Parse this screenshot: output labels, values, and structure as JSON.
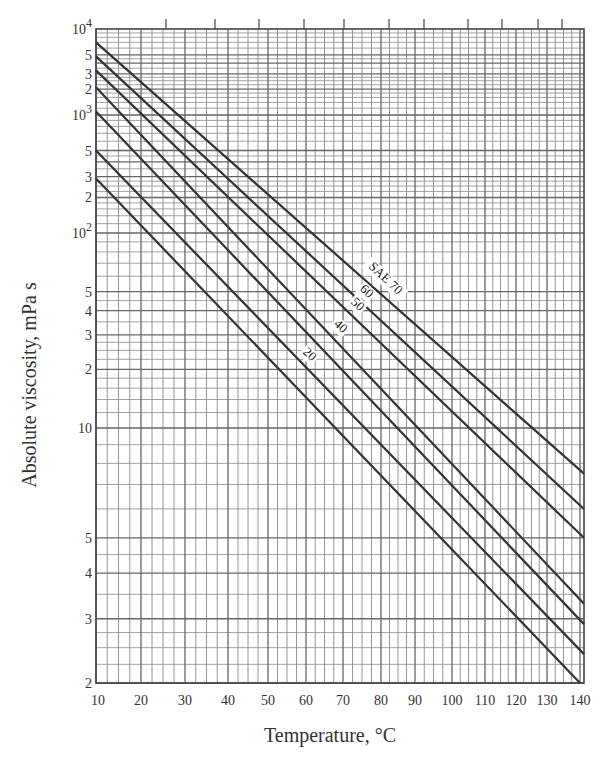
{
  "chart_data": {
    "type": "line",
    "title": "",
    "xlabel": "Temperature, °C",
    "ylabel": "Absolute viscosity, mPa s",
    "xscale": "viscosity-temperature (nonlinear)",
    "yscale": "log (viscosity-chart distorted)",
    "xlim": [
      10,
      142
    ],
    "ylim": [
      2,
      10000
    ],
    "grid": true,
    "legend": "inline labels on lines",
    "x_ticks": [
      10,
      20,
      30,
      40,
      50,
      60,
      70,
      80,
      90,
      100,
      110,
      120,
      130,
      140
    ],
    "x_tick_labels": [
      "10",
      "20",
      "30",
      "40",
      "50",
      "60",
      "70",
      "80",
      "90",
      "100",
      "110",
      "120",
      "130",
      "140"
    ],
    "y_ticks": [
      {
        "value": 10000,
        "label": "10",
        "sup": "4"
      },
      {
        "value": 5000,
        "label": "5"
      },
      {
        "value": 3000,
        "label": "3"
      },
      {
        "value": 2000,
        "label": "2"
      },
      {
        "value": 1000,
        "label": "10",
        "sup": "3"
      },
      {
        "value": 500,
        "label": "5"
      },
      {
        "value": 300,
        "label": "3"
      },
      {
        "value": 200,
        "label": "2"
      },
      {
        "value": 100,
        "label": "10",
        "sup": "2"
      },
      {
        "value": 50,
        "label": "5"
      },
      {
        "value": 40,
        "label": "4"
      },
      {
        "value": 30,
        "label": "3"
      },
      {
        "value": 20,
        "label": "2"
      },
      {
        "value": 10,
        "label": "10"
      },
      {
        "value": 5,
        "label": "5"
      },
      {
        "value": 4,
        "label": "4"
      },
      {
        "value": 3,
        "label": "3"
      },
      {
        "value": 2,
        "label": "2"
      }
    ],
    "series": [
      {
        "name": "SAE 70",
        "label": "SAE 70",
        "x": [
          10,
          142
        ],
        "y": [
          7000,
          7.5
        ]
      },
      {
        "name": "SAE 60",
        "label": "60",
        "x": [
          10,
          142
        ],
        "y": [
          4800,
          6.0
        ]
      },
      {
        "name": "SAE 50",
        "label": "50",
        "x": [
          10,
          142
        ],
        "y": [
          3300,
          5.0
        ]
      },
      {
        "name": "SAE 40",
        "label": "40",
        "x": [
          10,
          142
        ],
        "y": [
          2100,
          3.3
        ]
      },
      {
        "name": "SAE 30",
        "label": "",
        "x": [
          10,
          142
        ],
        "y": [
          1100,
          2.9
        ]
      },
      {
        "name": "SAE 20",
        "label": "20",
        "x": [
          10,
          142
        ],
        "y": [
          500,
          2.4
        ]
      },
      {
        "name": "SAE 10",
        "label": "",
        "x": [
          10,
          140
        ],
        "y": [
          290,
          2.0
        ]
      }
    ],
    "top_ticks_x_px": [
      166,
      215,
      259,
      304,
      344,
      389,
      424,
      468,
      502,
      538,
      562
    ]
  },
  "labels": {
    "xlabel": "Temperature, °C",
    "ylabel": "Absolute viscosity, mPa s"
  }
}
